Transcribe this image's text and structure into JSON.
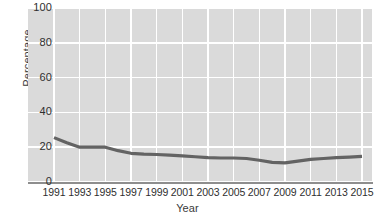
{
  "chart_data": {
    "type": "line",
    "title": "",
    "xlabel": "Year",
    "ylabel": "Percentage",
    "grid": true,
    "legend": false,
    "xlim": [
      1991,
      2015
    ],
    "ylim": [
      0,
      100
    ],
    "yticks": [
      0,
      20,
      40,
      60,
      80,
      100
    ],
    "xticks": [
      1991,
      1993,
      1995,
      1997,
      1999,
      2001,
      2003,
      2005,
      2007,
      2009,
      2011,
      2013,
      2015
    ],
    "x": [
      1991,
      1992,
      1993,
      1994,
      1995,
      1996,
      1997,
      1998,
      1999,
      2000,
      2001,
      2002,
      2003,
      2004,
      2005,
      2006,
      2007,
      2008,
      2009,
      2010,
      2011,
      2012,
      2013,
      2014,
      2015
    ],
    "values": [
      25.5,
      22.5,
      20.0,
      20.0,
      20.0,
      18.0,
      16.5,
      16.0,
      15.8,
      15.5,
      15.0,
      14.5,
      14.0,
      13.8,
      13.8,
      13.5,
      12.5,
      11.3,
      11.0,
      12.0,
      13.0,
      13.5,
      14.0,
      14.3,
      14.7
    ],
    "series": [
      {
        "name": "Percentage",
        "color": "#636363",
        "values": [
          25.5,
          22.5,
          20.0,
          20.0,
          20.0,
          18.0,
          16.5,
          16.0,
          15.8,
          15.5,
          15.0,
          14.5,
          14.0,
          13.8,
          13.8,
          13.5,
          12.5,
          11.3,
          11.0,
          12.0,
          13.0,
          13.5,
          14.0,
          14.3,
          14.7
        ]
      }
    ],
    "colors": {
      "plot_background": "#dadada",
      "gridline": "#ffffff",
      "line": "#636363",
      "axis_line": "#8e8e8e",
      "tick_text": "#2f2f2f",
      "axis_title_text": "#3b3b3b",
      "page_background": "#ffffff"
    }
  },
  "axes": {
    "y_title": "Percentage",
    "x_title": "Year",
    "y_tick_labels": [
      "0",
      "20",
      "40",
      "60",
      "80",
      "100"
    ],
    "x_tick_labels": [
      "1991",
      "1993",
      "1995",
      "1997",
      "1999",
      "2001",
      "2003",
      "2005",
      "2007",
      "2009",
      "2011",
      "2013",
      "2015"
    ]
  }
}
